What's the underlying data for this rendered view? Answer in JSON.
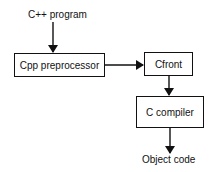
{
  "diagram": {
    "title": "",
    "input_label": "C++ program",
    "output_label": "Object code",
    "nodes": [
      {
        "id": "cpp",
        "label": "Cpp preprocessor"
      },
      {
        "id": "cfront",
        "label": "Cfront"
      },
      {
        "id": "ccompiler",
        "label": "C compiler"
      }
    ],
    "edges": [
      {
        "from": "C++ program",
        "to": "cpp"
      },
      {
        "from": "cpp",
        "to": "cfront"
      },
      {
        "from": "cfront",
        "to": "ccompiler"
      },
      {
        "from": "ccompiler",
        "to": "Object code"
      }
    ],
    "colors": {
      "stroke": "#111111",
      "background": "#ffffff"
    }
  }
}
